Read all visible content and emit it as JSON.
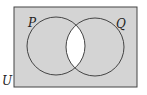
{
  "diagram": {
    "type": "venn",
    "universal_label": "U",
    "sets": [
      {
        "label": "P"
      },
      {
        "label": "Q"
      }
    ],
    "shaded_region": "complement of P ∩ Q",
    "colors": {
      "shade": "#d4d4d4",
      "stroke": "#444444",
      "unshaded": "#ffffff"
    }
  }
}
